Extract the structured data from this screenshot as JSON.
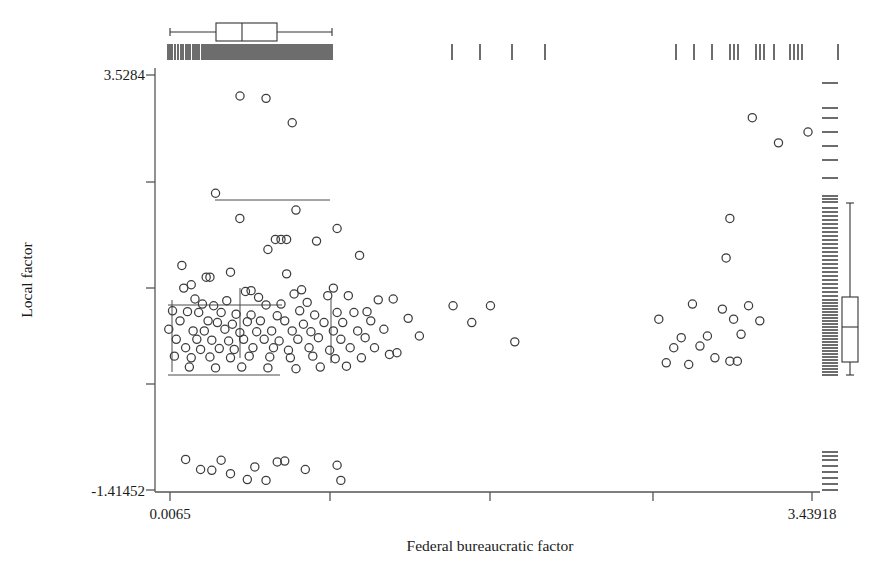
{
  "chart_data": {
    "type": "scatter",
    "title": "",
    "xlabel": "Federal bureaucratic factor",
    "ylabel": "Local factor",
    "xlim": [
      0.0065,
      3.43918
    ],
    "ylim": [
      -1.41452,
      3.5284
    ],
    "xtick_labels": [
      "0.0065",
      "3.43918"
    ],
    "ytick_labels": [
      "3.5284",
      "-1.41452"
    ],
    "xticks_px": [
      170,
      330,
      490,
      653,
      812
    ],
    "yticks_px": [
      75,
      182,
      288,
      384,
      490
    ],
    "grid": false,
    "legend": false,
    "marker": "open-circle",
    "marker_color": "#3d3d3d",
    "marker_radius": 4.1,
    "frame_color": "#555555",
    "points": [
      [
        0.52,
        3.25
      ],
      [
        0.66,
        2.96
      ],
      [
        0.25,
        2.12
      ],
      [
        0.68,
        1.92
      ],
      [
        0.38,
        1.82
      ],
      [
        0.9,
        1.7
      ],
      [
        0.6,
        1.57
      ],
      [
        0.63,
        1.57
      ],
      [
        0.57,
        1.57
      ],
      [
        0.79,
        1.55
      ],
      [
        0.53,
        1.45
      ],
      [
        1.02,
        1.38
      ],
      [
        0.07,
        1.26
      ],
      [
        0.33,
        1.18
      ],
      [
        0.2,
        1.12
      ],
      [
        0.22,
        1.12
      ],
      [
        0.63,
        1.16
      ],
      [
        0.12,
        1.03
      ],
      [
        0.08,
        0.99
      ],
      [
        0.41,
        0.95
      ],
      [
        0.44,
        0.96
      ],
      [
        0.88,
        0.99
      ],
      [
        0.14,
        0.86
      ],
      [
        0.31,
        0.84
      ],
      [
        0.48,
        0.88
      ],
      [
        0.67,
        0.92
      ],
      [
        0.71,
        0.97
      ],
      [
        0.85,
        0.9
      ],
      [
        0.96,
        0.9
      ],
      [
        0.18,
        0.8
      ],
      [
        0.24,
        0.78
      ],
      [
        0.52,
        0.79
      ],
      [
        0.6,
        0.8
      ],
      [
        0.74,
        0.82
      ],
      [
        1.12,
        0.85
      ],
      [
        1.2,
        0.86
      ],
      [
        0.02,
        0.72
      ],
      [
        0.1,
        0.71
      ],
      [
        0.16,
        0.7
      ],
      [
        0.28,
        0.7
      ],
      [
        0.36,
        0.68
      ],
      [
        0.44,
        0.67
      ],
      [
        0.58,
        0.66
      ],
      [
        0.7,
        0.72
      ],
      [
        0.78,
        0.67
      ],
      [
        0.9,
        0.7
      ],
      [
        0.99,
        0.7
      ],
      [
        1.06,
        0.71
      ],
      [
        0.06,
        0.6
      ],
      [
        0.21,
        0.6
      ],
      [
        0.26,
        0.58
      ],
      [
        0.34,
        0.56
      ],
      [
        0.42,
        0.59
      ],
      [
        0.49,
        0.6
      ],
      [
        0.62,
        0.6
      ],
      [
        0.72,
        0.56
      ],
      [
        0.83,
        0.58
      ],
      [
        0.93,
        0.58
      ],
      [
        1.08,
        0.6
      ],
      [
        1.28,
        0.63
      ],
      [
        0.0,
        0.5
      ],
      [
        0.13,
        0.48
      ],
      [
        0.19,
        0.48
      ],
      [
        0.3,
        0.5
      ],
      [
        0.38,
        0.46
      ],
      [
        0.47,
        0.47
      ],
      [
        0.55,
        0.48
      ],
      [
        0.66,
        0.48
      ],
      [
        0.76,
        0.47
      ],
      [
        0.88,
        0.48
      ],
      [
        1.01,
        0.48
      ],
      [
        1.15,
        0.5
      ],
      [
        0.04,
        0.38
      ],
      [
        0.15,
        0.38
      ],
      [
        0.23,
        0.37
      ],
      [
        0.32,
        0.36
      ],
      [
        0.4,
        0.38
      ],
      [
        0.51,
        0.38
      ],
      [
        0.59,
        0.36
      ],
      [
        0.69,
        0.38
      ],
      [
        0.8,
        0.4
      ],
      [
        0.92,
        0.38
      ],
      [
        1.05,
        0.4
      ],
      [
        1.34,
        0.42
      ],
      [
        0.09,
        0.28
      ],
      [
        0.17,
        0.26
      ],
      [
        0.27,
        0.27
      ],
      [
        0.35,
        0.26
      ],
      [
        0.45,
        0.28
      ],
      [
        0.56,
        0.28
      ],
      [
        0.64,
        0.25
      ],
      [
        0.75,
        0.28
      ],
      [
        0.86,
        0.25
      ],
      [
        0.97,
        0.28
      ],
      [
        1.1,
        0.28
      ],
      [
        0.03,
        0.18
      ],
      [
        0.12,
        0.16
      ],
      [
        0.22,
        0.17
      ],
      [
        0.33,
        0.16
      ],
      [
        0.43,
        0.18
      ],
      [
        0.54,
        0.17
      ],
      [
        0.65,
        0.16
      ],
      [
        0.77,
        0.18
      ],
      [
        0.89,
        0.15
      ],
      [
        1.03,
        0.16
      ],
      [
        1.18,
        0.2
      ],
      [
        0.11,
        0.05
      ],
      [
        0.25,
        0.04
      ],
      [
        0.39,
        0.05
      ],
      [
        0.53,
        0.04
      ],
      [
        0.68,
        0.03
      ],
      [
        0.81,
        0.05
      ],
      [
        0.95,
        0.06
      ],
      [
        1.22,
        0.22
      ],
      [
        0.09,
        -1.05
      ],
      [
        0.28,
        -1.06
      ],
      [
        0.17,
        -1.17
      ],
      [
        0.23,
        -1.18
      ],
      [
        0.33,
        -1.22
      ],
      [
        0.46,
        -1.14
      ],
      [
        0.58,
        -1.08
      ],
      [
        0.62,
        -1.07
      ],
      [
        0.42,
        -1.29
      ],
      [
        0.52,
        -1.3
      ],
      [
        0.73,
        -1.17
      ],
      [
        0.9,
        -1.12
      ],
      [
        0.92,
        -1.3
      ],
      [
        1.52,
        0.78
      ],
      [
        1.72,
        0.78
      ],
      [
        1.62,
        0.58
      ],
      [
        1.85,
        0.35
      ],
      [
        2.62,
        0.62
      ],
      [
        2.8,
        0.8
      ],
      [
        2.96,
        0.74
      ],
      [
        3.02,
        0.62
      ],
      [
        2.74,
        0.4
      ],
      [
        2.88,
        0.42
      ],
      [
        3.1,
        0.78
      ],
      [
        3.16,
        0.6
      ],
      [
        2.7,
        0.28
      ],
      [
        2.84,
        0.3
      ],
      [
        3.06,
        0.44
      ],
      [
        2.92,
        0.16
      ],
      [
        2.66,
        0.1
      ],
      [
        2.78,
        0.08
      ],
      [
        3.0,
        0.12
      ],
      [
        3.04,
        0.12
      ],
      [
        2.98,
        1.35
      ],
      [
        3.12,
        3.02
      ],
      [
        3.26,
        2.72
      ],
      [
        3.0,
        1.82
      ]
    ],
    "top_boxplot": {
      "orientation": "horizontal",
      "whisker_low_px": 170,
      "q1_px": 216,
      "median_px": 242,
      "q3_px": 277,
      "whisker_high_px": 332,
      "y_px": 32
    },
    "right_boxplot": {
      "orientation": "vertical",
      "whisker_high_px": 203,
      "q3_px": 297,
      "median_px": 327,
      "q1_px": 362,
      "whisker_low_px": 375,
      "x_px": 850
    },
    "inner_overlay": {
      "h_line_y_px": 200,
      "h_line_x1_px": 215,
      "h_line_x2_px": 330,
      "cross_h_y_px": 305,
      "cross_h_x1_px": 168,
      "cross_h_x2_px": 282,
      "cross_v_x_px": 240,
      "cross_v_y1_px": 288,
      "cross_v_y2_px": 358,
      "bottom_h_y_px": 375,
      "bottom_h_x1_px": 168,
      "bottom_h_x2_px": 280,
      "left_v_x_px": 172,
      "left_v_y1_px": 300,
      "left_v_y2_px": 372,
      "right_v_x_px": 331,
      "right_v_y1_px": 298,
      "right_v_y2_px": 363
    },
    "top_rug_px": [
      168,
      170,
      172,
      175,
      178,
      181,
      183,
      186,
      188,
      190,
      193,
      195,
      197,
      199,
      202,
      204,
      206,
      208,
      210,
      212,
      214,
      216,
      218,
      220,
      222,
      224,
      226,
      228,
      230,
      232,
      234,
      236,
      238,
      240,
      242,
      244,
      246,
      248,
      250,
      252,
      254,
      256,
      258,
      260,
      262,
      264,
      266,
      268,
      270,
      272,
      274,
      276,
      278,
      280,
      282,
      284,
      286,
      288,
      290,
      292,
      294,
      296,
      298,
      300,
      302,
      304,
      306,
      308,
      310,
      312,
      314,
      316,
      318,
      320,
      322,
      324,
      326,
      328,
      330,
      332,
      452,
      480,
      512,
      545,
      676,
      694,
      712,
      730,
      734,
      738,
      756,
      760,
      764,
      774,
      790,
      794,
      798,
      802,
      838
    ],
    "right_rug_px": [
      83,
      108,
      118,
      132,
      146,
      160,
      178,
      196,
      199,
      202,
      208,
      212,
      216,
      220,
      224,
      228,
      232,
      236,
      240,
      244,
      248,
      252,
      256,
      260,
      264,
      268,
      272,
      276,
      280,
      284,
      288,
      292,
      296,
      300,
      303,
      306,
      309,
      312,
      315,
      318,
      321,
      324,
      327,
      330,
      333,
      336,
      339,
      342,
      345,
      348,
      351,
      354,
      357,
      360,
      363,
      366,
      369,
      372,
      375,
      452,
      456,
      460,
      466,
      472,
      478,
      484,
      490
    ],
    "top_outlier_px": {
      "x": 240,
      "y": 96
    },
    "right_outlier_px": {
      "x": 808,
      "y": 132
    }
  },
  "plot_geometry": {
    "frame_left": 155,
    "frame_right": 820,
    "frame_top": 68,
    "frame_bottom": 492
  }
}
